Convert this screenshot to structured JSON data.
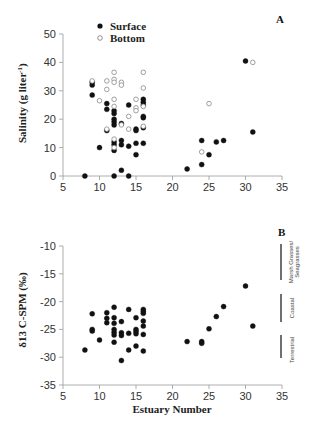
{
  "chart_data": [
    {
      "type": "scatter",
      "panel": "A",
      "xlabel": "",
      "ylabel": "Salinity (g liter-1)",
      "xlim": [
        5,
        35
      ],
      "ylim": [
        0,
        50
      ],
      "xticks": [
        5,
        10,
        15,
        20,
        25,
        30,
        35
      ],
      "yticks": [
        0,
        10,
        20,
        30,
        40,
        50
      ],
      "legend": [
        "Surface",
        "Bottom"
      ],
      "legend_position": "top-left",
      "series": [
        {
          "name": "Surface",
          "marker": "filled-circle",
          "points": [
            [
              8,
              0
            ],
            [
              9,
              32
            ],
            [
              9,
              33
            ],
            [
              9,
              28.5
            ],
            [
              10,
              10
            ],
            [
              11,
              25.5
            ],
            [
              11,
              23.5
            ],
            [
              11,
              16
            ],
            [
              12,
              23
            ],
            [
              12,
              22
            ],
            [
              12,
              20
            ],
            [
              12,
              19
            ],
            [
              12,
              18
            ],
            [
              12,
              12
            ],
            [
              12,
              11
            ],
            [
              12,
              9
            ],
            [
              12,
              0
            ],
            [
              13,
              18.5
            ],
            [
              13,
              12.5
            ],
            [
              13,
              11
            ],
            [
              13,
              2
            ],
            [
              14,
              25
            ],
            [
              14,
              10.5
            ],
            [
              14,
              0
            ],
            [
              15,
              16.5
            ],
            [
              15,
              16
            ],
            [
              15,
              11.5
            ],
            [
              15,
              7.5
            ],
            [
              16,
              27
            ],
            [
              16,
              26
            ],
            [
              16,
              25
            ],
            [
              16,
              21
            ],
            [
              16,
              20.5
            ],
            [
              16,
              17
            ],
            [
              16,
              11.5
            ],
            [
              22,
              2.5
            ],
            [
              24,
              12.5
            ],
            [
              24,
              4
            ],
            [
              25,
              7.5
            ],
            [
              26,
              12
            ],
            [
              27,
              12.5
            ],
            [
              30,
              40.5
            ],
            [
              31,
              15.5
            ]
          ]
        },
        {
          "name": "Bottom",
          "marker": "open-circle",
          "points": [
            [
              9,
              33.5
            ],
            [
              10,
              26.5
            ],
            [
              11,
              33.5
            ],
            [
              11,
              30.5
            ],
            [
              11,
              16.5
            ],
            [
              12,
              36.5
            ],
            [
              12,
              34
            ],
            [
              12,
              33
            ],
            [
              12,
              27
            ],
            [
              12,
              24.5
            ],
            [
              12,
              13
            ],
            [
              12,
              10
            ],
            [
              13,
              33
            ],
            [
              13,
              32
            ],
            [
              13,
              18
            ],
            [
              14,
              21
            ],
            [
              14,
              16.5
            ],
            [
              15,
              27
            ],
            [
              15,
              24
            ],
            [
              15,
              23
            ],
            [
              16,
              36.5
            ],
            [
              16,
              31
            ],
            [
              16,
              24.5
            ],
            [
              16,
              17.5
            ],
            [
              24,
              8.5
            ],
            [
              25,
              25.5
            ],
            [
              31,
              40
            ]
          ]
        }
      ]
    },
    {
      "type": "scatter",
      "panel": "B",
      "xlabel": "Estuary Number",
      "ylabel": "δ13 C-SPM (‰)",
      "xlim": [
        5,
        35
      ],
      "ylim": [
        -35,
        -10
      ],
      "xticks": [
        5,
        10,
        15,
        20,
        25,
        30,
        35
      ],
      "yticks": [
        -10,
        -15,
        -20,
        -25,
        -30,
        -35
      ],
      "series": [
        {
          "name": "δ13 C-SPM",
          "marker": "filled-circle",
          "points": [
            [
              8,
              -28.7
            ],
            [
              9,
              -22.2
            ],
            [
              9,
              -25
            ],
            [
              9,
              -25.3
            ],
            [
              10,
              -26.9
            ],
            [
              11,
              -22
            ],
            [
              11,
              -23
            ],
            [
              11,
              -23.8
            ],
            [
              12,
              -21
            ],
            [
              12,
              -22.9
            ],
            [
              12,
              -23.9
            ],
            [
              12,
              -25
            ],
            [
              12,
              -25.5
            ],
            [
              12,
              -26
            ],
            [
              12,
              -27.3
            ],
            [
              13,
              -23.6
            ],
            [
              13,
              -25.6
            ],
            [
              13,
              -26.1
            ],
            [
              13,
              -30.6
            ],
            [
              14,
              -21.4
            ],
            [
              14,
              -25.7
            ],
            [
              14,
              -28.7
            ],
            [
              15,
              -22.9
            ],
            [
              15,
              -25
            ],
            [
              15,
              -25.4
            ],
            [
              15,
              -25.8
            ],
            [
              15,
              -28
            ],
            [
              16,
              -21.4
            ],
            [
              16,
              -21.8
            ],
            [
              16,
              -22.1
            ],
            [
              16,
              -23.5
            ],
            [
              16,
              -24.4
            ],
            [
              16,
              -25.9
            ],
            [
              16,
              -28.9
            ],
            [
              22,
              -27.2
            ],
            [
              24,
              -27.2
            ],
            [
              24,
              -27.5
            ],
            [
              25,
              -24.9
            ],
            [
              26,
              -22.7
            ],
            [
              27,
              -20.9
            ],
            [
              30,
              -17.2
            ],
            [
              31,
              -24.4
            ]
          ]
        }
      ],
      "annotations": [
        {
          "label": "Marsh Grasses/ Seagrasses",
          "range": [
            -16,
            -10
          ]
        },
        {
          "label": "Coastal",
          "range": [
            -23.5,
            -18.5
          ]
        },
        {
          "label": "Terrestrial",
          "range": [
            -30,
            -26
          ]
        }
      ]
    }
  ],
  "panels": {
    "a": {
      "label": "A",
      "ylabel": "Salinity (g liter",
      "ylabel_sup": "-1",
      "ylabel_close": ")",
      "legend_surface": "Surface",
      "legend_bottom": "Bottom"
    },
    "b": {
      "label": "B",
      "ylabel": "δ13 C-SPM (‰)",
      "xlabel": "Estuary Number",
      "ann_marsh_1": "Marsh Grasses/",
      "ann_marsh_2": "Seagrasses",
      "ann_coastal": "Coastal",
      "ann_terrestrial": "Terrestrial"
    }
  }
}
